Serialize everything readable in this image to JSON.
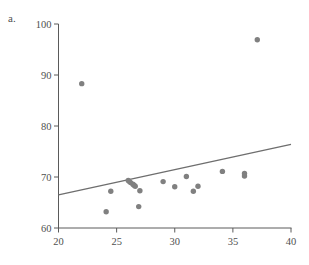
{
  "figure": {
    "panel_label": "a.",
    "point_color": "#808080",
    "line_color": "#6e6e6e",
    "axis_color": "#5a5a5a",
    "background": "#ffffff"
  },
  "chart_data": {
    "type": "scatter",
    "title": "",
    "xlabel": "",
    "ylabel": "",
    "xlim": [
      20,
      40
    ],
    "ylim": [
      60,
      100
    ],
    "xticks": [
      20,
      25,
      30,
      35,
      40
    ],
    "yticks": [
      60,
      70,
      80,
      90,
      100
    ],
    "xtick_labels": [
      "20",
      "25",
      "30",
      "35",
      "40"
    ],
    "ytick_labels": [
      "60",
      "70",
      "80",
      "90",
      "100"
    ],
    "grid": false,
    "legend": null,
    "series": [
      {
        "name": "observations",
        "marker": "circle",
        "color": "#808080",
        "x": [
          22.0,
          24.1,
          24.5,
          26.0,
          26.1,
          26.2,
          26.4,
          26.5,
          26.6,
          26.9,
          27.0,
          29.0,
          30.0,
          31.0,
          31.6,
          32.0,
          34.1,
          36.0,
          36.0,
          37.1
        ],
        "y": [
          88.3,
          63.2,
          67.2,
          69.3,
          69.1,
          68.9,
          68.6,
          68.4,
          68.2,
          64.2,
          67.3,
          69.1,
          68.1,
          70.1,
          67.2,
          68.2,
          71.1,
          70.7,
          70.2,
          96.9
        ]
      }
    ],
    "fit_line": {
      "name": "regression-line",
      "color": "#6e6e6e",
      "x_start": 20,
      "y_start": 66.5,
      "x_end": 40,
      "y_end": 76.4
    }
  }
}
